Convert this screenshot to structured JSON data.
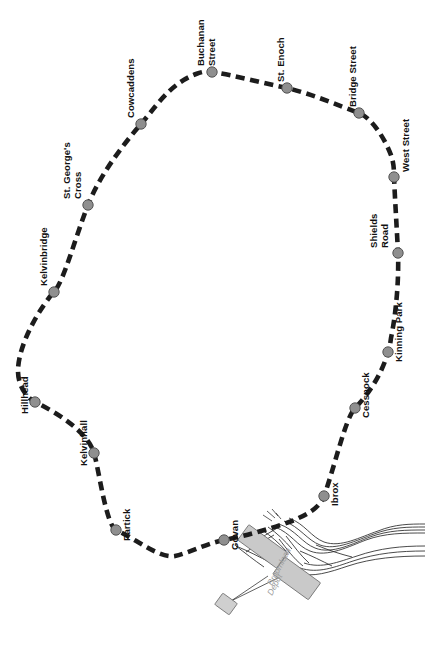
{
  "map": {
    "title": "Glasgow Subway Line Diagram",
    "width": 425,
    "height": 647,
    "background_color": "#ffffff",
    "route": {
      "name": "Subway Circle",
      "line_color": "#1c1c1c",
      "line_style": "dashed",
      "station_marker_color": "#8f8f8f",
      "station_marker_outline": "#4a4a4a"
    },
    "stations": [
      {
        "id": "buchanan-street",
        "label": "Buchanan Street",
        "lines": [
          "Buchanan",
          "Street"
        ],
        "x": 212,
        "y": 72,
        "label_x": 207,
        "label_y": 66,
        "label_rotation": -90
      },
      {
        "id": "st-enoch",
        "label": "St. Enoch",
        "lines": [
          "St. Enoch"
        ],
        "x": 287,
        "y": 88,
        "label_x": 283,
        "label_y": 82,
        "label_rotation": -90
      },
      {
        "id": "bridge-street",
        "label": "Bridge Street",
        "lines": [
          "Bridge Street"
        ],
        "x": 359,
        "y": 113,
        "label_x": 355,
        "label_y": 107,
        "label_rotation": -90
      },
      {
        "id": "west-street",
        "label": "West Street",
        "lines": [
          "West Street"
        ],
        "x": 394,
        "y": 177,
        "label_x": 406,
        "label_y": 172,
        "label_rotation": -90
      },
      {
        "id": "shields-road",
        "label": "Shields Road",
        "lines": [
          "Shields",
          "Road"
        ],
        "x": 398,
        "y": 253,
        "label_x": 380,
        "label_y": 248,
        "label_rotation": -90
      },
      {
        "id": "kinning-park",
        "label": "Kinning Park",
        "lines": [
          "Kinning Park"
        ],
        "x": 388,
        "y": 352,
        "label_x": 399,
        "label_y": 360,
        "label_rotation": -90
      },
      {
        "id": "cessnock",
        "label": "Cessnock",
        "lines": [
          "Cessnock"
        ],
        "x": 355,
        "y": 408,
        "label_x": 367,
        "label_y": 416,
        "label_rotation": -90
      },
      {
        "id": "ibrox",
        "label": "Ibrox",
        "lines": [
          "Ibrox"
        ],
        "x": 324,
        "y": 496,
        "label_x": 335,
        "label_y": 504,
        "label_rotation": -90
      },
      {
        "id": "govan",
        "label": "Govan",
        "lines": [
          "Govan"
        ],
        "x": 224,
        "y": 540,
        "label_x": 235,
        "label_y": 548,
        "label_rotation": -90
      },
      {
        "id": "partick",
        "label": "Partick",
        "lines": [
          "Partick"
        ],
        "x": 116,
        "y": 530,
        "label_x": 127,
        "label_y": 538,
        "label_rotation": -90
      },
      {
        "id": "kelvinhall",
        "label": "Kelvinhall",
        "lines": [
          "Kelvinhall"
        ],
        "x": 94,
        "y": 453,
        "label_x": 89,
        "label_y": 461,
        "label_rotation": -90
      },
      {
        "id": "hillhead",
        "label": "Hillhead",
        "lines": [
          "Hillhead"
        ],
        "x": 35,
        "y": 402,
        "label_x": 31,
        "label_y": 410,
        "label_rotation": -90
      },
      {
        "id": "kelvinbridge",
        "label": "Kelvinbridge",
        "lines": [
          "Kelvinbridge"
        ],
        "x": 54,
        "y": 292,
        "label_x": 49,
        "label_y": 286,
        "label_rotation": -90
      },
      {
        "id": "st-georges-cross",
        "label": "St. George's Cross",
        "lines": [
          "St. George's",
          "Cross"
        ],
        "x": 88,
        "y": 205,
        "label_x": 72,
        "label_y": 199,
        "label_rotation": -90
      },
      {
        "id": "cowcaddens",
        "label": "Cowcaddens",
        "lines": [
          "Cowcaddens"
        ],
        "x": 141,
        "y": 124,
        "label_x": 136,
        "label_y": 118,
        "label_rotation": -90
      }
    ],
    "depot": {
      "id": "broomloan-depot",
      "label": "Broomloan Depot",
      "lines": [
        "Broomloan",
        "Depot"
      ],
      "label_x": 272,
      "label_y": 586,
      "label_rotation": -62,
      "label_color": "#9a9a9a",
      "building_color": "#c9c9c9",
      "track_color": "#2a2a2a"
    }
  }
}
